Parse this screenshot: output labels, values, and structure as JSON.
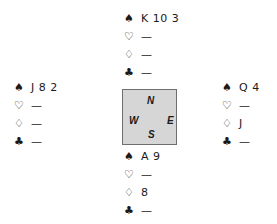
{
  "diagram": {
    "type": "bridge-deal",
    "suit_symbols": {
      "spades": "♠",
      "hearts": "♡",
      "diamonds": "♢",
      "clubs": "♣"
    },
    "hands": {
      "north": {
        "spades": "K 10 3",
        "hearts": "—",
        "diamonds": "—",
        "clubs": "—"
      },
      "west": {
        "spades": "J 8 2",
        "hearts": "—",
        "diamonds": "—",
        "clubs": "—"
      },
      "east": {
        "spades": "Q 4",
        "hearts": "—",
        "diamonds": "J",
        "clubs": "—"
      },
      "south": {
        "spades": "A 9",
        "hearts": "—",
        "diamonds": "8",
        "clubs": "—"
      }
    },
    "compass": {
      "north": "N",
      "west": "W",
      "east": "E",
      "south": "S",
      "fill_color": "#d6d6d6",
      "border_color": "#6f6f6f"
    }
  }
}
